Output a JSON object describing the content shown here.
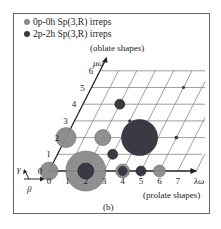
{
  "chart_data": {
    "type": "scatter",
    "title": "",
    "panel_label": "(b)",
    "xlabel": "λω",
    "ylabel": "μω",
    "x_annotation": "(prolate shapes)",
    "y_annotation": "(oblate shapes)",
    "x_ticks": [
      "0",
      "1",
      "2",
      "3",
      "4",
      "5",
      "6",
      "7"
    ],
    "y_ticks": [
      "0",
      "1",
      "2",
      "3",
      "4",
      "5",
      "6"
    ],
    "xlim": [
      0,
      7
    ],
    "ylim": [
      0,
      6
    ],
    "grid": true,
    "legend_position": "top-left",
    "corner_axes": {
      "up": "γ",
      "right": "β"
    },
    "series": [
      {
        "name": "0p-0h Sp(3,R) irreps",
        "color": "#8a8a8a",
        "points": [
          {
            "x": 0,
            "y": 0,
            "size": 9
          },
          {
            "x": 2,
            "y": 0,
            "size": 20
          },
          {
            "x": 4,
            "y": 0,
            "size": 7
          },
          {
            "x": 6,
            "y": 0,
            "size": 6
          },
          {
            "x": 0,
            "y": 2,
            "size": 10
          },
          {
            "x": 2,
            "y": 2,
            "size": 8
          }
        ]
      },
      {
        "name": "2p-2h Sp(3,R) irreps",
        "color": "#3a3a44",
        "points": [
          {
            "x": 2,
            "y": 0,
            "size": 8
          },
          {
            "x": 4,
            "y": 0,
            "size": 4.5
          },
          {
            "x": 5,
            "y": 0,
            "size": 5
          },
          {
            "x": 3,
            "y": 1,
            "size": 5
          },
          {
            "x": 4,
            "y": 2,
            "size": 18
          },
          {
            "x": 2,
            "y": 4,
            "size": 5
          },
          {
            "x": 6,
            "y": 2,
            "size": 1.5
          },
          {
            "x": 3,
            "y": 3,
            "size": 1.2
          },
          {
            "x": 5,
            "y": 5,
            "size": 1.2
          }
        ]
      }
    ]
  }
}
